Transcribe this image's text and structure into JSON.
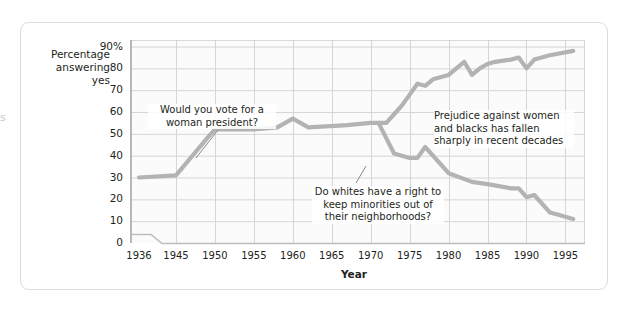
{
  "page": {
    "edge_text": "s"
  },
  "axes": {
    "y_title_line1": "Percentage",
    "y_title_line2": "answering yes",
    "x_title": "Year",
    "y_ticks": [
      "90%",
      "80",
      "70",
      "60",
      "50",
      "40",
      "30",
      "20",
      "10",
      "0"
    ],
    "x_ticks": [
      "1936",
      "1945",
      "1950",
      "1955",
      "1960",
      "1965",
      "1970",
      "1975",
      "1980",
      "1985",
      "1990",
      "1995"
    ],
    "axis_break": "axis-break-zigzag"
  },
  "annotations": {
    "woman_president": "Would you vote for a woman president?",
    "whites_neighborhoods": "Do whites have a right to keep minorities out of their neighborhoods?",
    "prejudice": "Prejudice against women and blacks has fallen sharply in recent decades"
  },
  "colors": {
    "line": "#b3b3b3",
    "grid": "#d6d6d6",
    "axis": "#9a9a9a",
    "text": "#231f20",
    "card_border": "#dcdcdc",
    "plot_bg": "#fbfbfb"
  },
  "chart_data": {
    "type": "line",
    "title": "",
    "xlabel": "Year",
    "ylabel": "Percentage answering yes",
    "xlim": [
      1936,
      1997
    ],
    "ylim": [
      0,
      93
    ],
    "grid": true,
    "legend": "none (inline annotations)",
    "x_tick_values": [
      1936,
      1945,
      1950,
      1955,
      1960,
      1965,
      1970,
      1975,
      1980,
      1985,
      1990,
      1995
    ],
    "y_tick_values": [
      0,
      10,
      20,
      30,
      40,
      50,
      60,
      70,
      80,
      90
    ],
    "series": [
      {
        "name": "Would you vote for a woman president?",
        "points": [
          [
            1936,
            30
          ],
          [
            1945,
            31
          ],
          [
            1949,
            48
          ],
          [
            1950,
            52
          ],
          [
            1955,
            52
          ],
          [
            1958,
            53
          ],
          [
            1960,
            57
          ],
          [
            1962,
            53
          ],
          [
            1967,
            54
          ],
          [
            1970,
            55
          ],
          [
            1972,
            55
          ],
          [
            1974,
            63
          ],
          [
            1975,
            68
          ],
          [
            1976,
            73
          ],
          [
            1977,
            72
          ],
          [
            1978,
            75
          ],
          [
            1980,
            77
          ],
          [
            1982,
            83
          ],
          [
            1983,
            77
          ],
          [
            1984,
            80
          ],
          [
            1985,
            82
          ],
          [
            1986,
            83
          ],
          [
            1988,
            84
          ],
          [
            1989,
            85
          ],
          [
            1990,
            80
          ],
          [
            1991,
            84
          ],
          [
            1993,
            86
          ],
          [
            1996,
            88
          ]
        ]
      },
      {
        "name": "Do whites have a right to keep minorities out of their neighborhoods?",
        "points": [
          [
            1971,
            55
          ],
          [
            1973,
            41
          ],
          [
            1975,
            39
          ],
          [
            1976,
            39
          ],
          [
            1977,
            44
          ],
          [
            1980,
            32
          ],
          [
            1983,
            28
          ],
          [
            1985,
            27
          ],
          [
            1988,
            25
          ],
          [
            1989,
            25
          ],
          [
            1990,
            21
          ],
          [
            1991,
            22
          ],
          [
            1993,
            14
          ],
          [
            1994,
            13
          ],
          [
            1996,
            11
          ]
        ]
      }
    ]
  }
}
